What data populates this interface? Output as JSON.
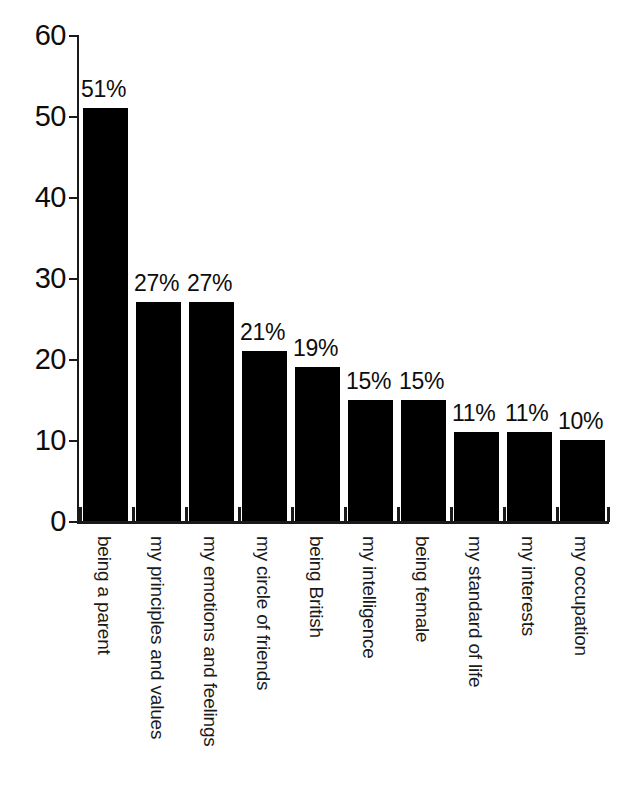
{
  "chart_data": {
    "type": "bar",
    "title": "",
    "subtitle": "",
    "xlabel": "",
    "ylabel": "",
    "ylim": [
      0,
      60
    ],
    "grid": false,
    "legend": "none",
    "orientation": "vertical",
    "bar_color": "#000000",
    "categories": [
      "being a parent",
      "my principles and values",
      "my emotions and feelings",
      "my circle of friends",
      "being British",
      "my intelligence",
      "being female",
      "my standard of life",
      "my interests",
      "my occupation"
    ],
    "values": [
      51,
      27,
      27,
      21,
      19,
      15,
      15,
      11,
      11,
      10
    ],
    "data_labels": [
      "51%",
      "27%",
      "27%",
      "21%",
      "19%",
      "15%",
      "15%",
      "11%",
      "11%",
      "10%"
    ],
    "yticks": [
      0,
      10,
      20,
      30,
      40,
      50,
      60
    ],
    "ytick_labels": [
      "0",
      "10",
      "20",
      "30",
      "40",
      "50",
      "60"
    ]
  },
  "axis": {
    "y_labels": [
      "60",
      "50",
      "40",
      "30",
      "20",
      "10",
      "0"
    ]
  }
}
